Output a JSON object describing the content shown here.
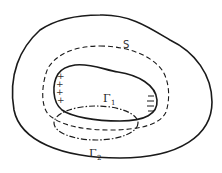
{
  "diagram": {
    "labels": {
      "surface": "S",
      "gamma1_main": "Γ",
      "gamma1_sub": "1",
      "gamma2_main": "Γ",
      "gamma2_sub": "2"
    },
    "charges": {
      "positive_symbol": "+",
      "positive_count": 4,
      "negative_symbol": "−",
      "negative_count": 4
    },
    "curves": [
      {
        "name": "outer-region-boundary",
        "style": "solid"
      },
      {
        "name": "surface-s",
        "style": "dashed"
      },
      {
        "name": "gamma1-loop",
        "style": "solid"
      },
      {
        "name": "gamma2-loop",
        "style": "dash-dot"
      }
    ],
    "colors": {
      "stroke": "#1a1a1a",
      "background": "#ffffff"
    }
  }
}
